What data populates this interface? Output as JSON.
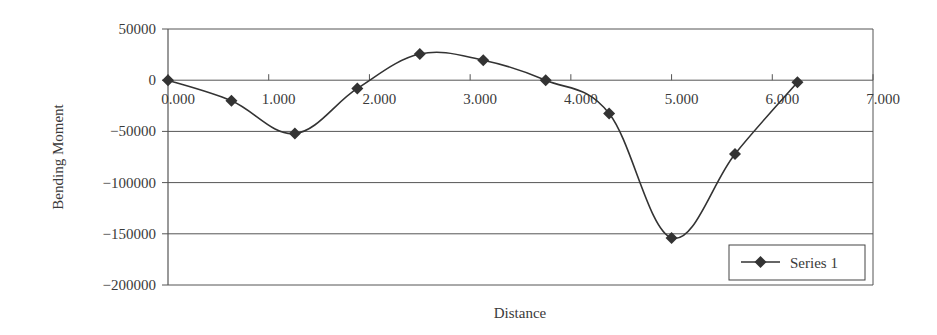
{
  "chart_data": {
    "type": "line",
    "title": "",
    "xlabel": "Distance",
    "ylabel": "Bending Moment",
    "xlim": [
      0,
      7
    ],
    "ylim": [
      -200000,
      50000
    ],
    "x_ticks": [
      0,
      1,
      2,
      3,
      4,
      5,
      6,
      7
    ],
    "x_tick_labels": [
      "0.000",
      "1.000",
      "2.000",
      "3.000",
      "4.000",
      "5.000",
      "6.000",
      "7.000"
    ],
    "y_ticks": [
      50000,
      0,
      -50000,
      -100000,
      -150000,
      -200000
    ],
    "y_tick_labels": [
      "50000",
      "0",
      "−50000",
      "−100000",
      "−150000",
      "−200000"
    ],
    "grid": "horizontal",
    "legend": {
      "position": "bottom-right",
      "entries": [
        "Series 1"
      ]
    },
    "series": [
      {
        "name": "Series 1",
        "marker": "diamond",
        "smooth": true,
        "x": [
          0.0,
          0.63,
          1.26,
          1.88,
          2.5,
          3.13,
          3.75,
          4.38,
          5.0,
          5.63,
          6.25
        ],
        "y": [
          0,
          -20000,
          -52000,
          -8000,
          25500,
          19500,
          0,
          -32500,
          -154000,
          -72000,
          -2000
        ]
      }
    ]
  },
  "colors": {
    "line": "#333333",
    "grid": "#555555",
    "text": "#3a3a3a"
  }
}
